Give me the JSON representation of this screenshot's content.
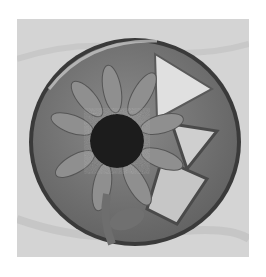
{
  "image": {
    "description": "Grayscale photograph of a round glass/resin paperweight containing a pressed sunflower and triangular translucent pieces, resting on a light fabric background",
    "colors": {
      "page_background": "#ffffff",
      "fabric": "#d2d2d2",
      "disc": "#7a7a7a",
      "rim": "#3c3c3c",
      "petals": "#8e8e8e",
      "flower_center": "#1e1e1e",
      "light_triangle": "#e2e2e2",
      "mid_triangle": "#c4c4c4"
    }
  }
}
